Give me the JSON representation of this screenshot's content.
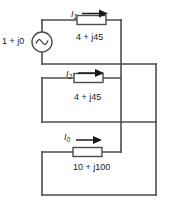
{
  "figure": {
    "name": "ac-circuit-three-parallel-branches",
    "background_color": "#ffffff",
    "wire_color": "#4d4d4d",
    "text_color": "#1a1a1a"
  },
  "source": {
    "label": "1 + j0",
    "symbol": "ac-source-sine",
    "type": "ac-voltage-source"
  },
  "branches": [
    {
      "current_label_main": "I",
      "current_label_sub": "1",
      "impedance": "4 + j45",
      "element": "impedance-box"
    },
    {
      "current_label_main": "I",
      "current_label_sub": "2",
      "impedance": "4 + j45",
      "element": "impedance-box"
    },
    {
      "current_label_main": "I",
      "current_label_sub": "0",
      "impedance": "10 + j100",
      "element": "impedance-box"
    }
  ],
  "arrows": {
    "direction": "right",
    "count": 3
  }
}
